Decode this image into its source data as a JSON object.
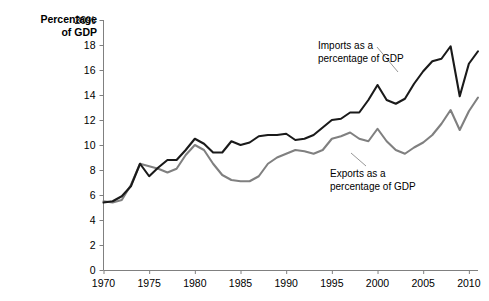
{
  "chart_data": {
    "type": "line",
    "title": "",
    "xlabel": "",
    "ylabel": "Percentage of GDP",
    "ylabel_line1": "Percentage",
    "ylabel_line2": "of GDP",
    "xlim": [
      1970,
      2011
    ],
    "ylim": [
      0,
      20
    ],
    "grid": false,
    "legend_position": "inline-annotations",
    "y_ticks": [
      0,
      2,
      4,
      6,
      8,
      10,
      12,
      14,
      16,
      18,
      20
    ],
    "y_tick_labels": [
      "0",
      "2",
      "4",
      "6",
      "8",
      "10",
      "12",
      "14",
      "16",
      "18",
      "20%"
    ],
    "x_ticks": [
      1970,
      1975,
      1980,
      1985,
      1990,
      1995,
      2000,
      2005,
      2010
    ],
    "x_tick_labels": [
      "1970",
      "1975",
      "1980",
      "1985",
      "1990",
      "1995",
      "2000",
      "2005",
      "2010"
    ],
    "x": [
      1970,
      1971,
      1972,
      1973,
      1974,
      1975,
      1976,
      1977,
      1978,
      1979,
      1980,
      1981,
      1982,
      1983,
      1984,
      1985,
      1986,
      1987,
      1988,
      1989,
      1990,
      1991,
      1992,
      1993,
      1994,
      1995,
      1996,
      1997,
      1998,
      1999,
      2000,
      2001,
      2002,
      2003,
      2004,
      2005,
      2006,
      2007,
      2008,
      2009,
      2010,
      2011
    ],
    "series": [
      {
        "name": "Imports as a percentage of GDP",
        "color": "#1a1a1a",
        "values": [
          5.4,
          5.5,
          5.9,
          6.7,
          8.5,
          7.5,
          8.2,
          8.8,
          8.8,
          9.6,
          10.5,
          10.1,
          9.4,
          9.4,
          10.3,
          10.0,
          10.2,
          10.7,
          10.8,
          10.8,
          10.9,
          10.4,
          10.5,
          10.8,
          11.4,
          12.0,
          12.1,
          12.6,
          12.6,
          13.6,
          14.8,
          13.6,
          13.3,
          13.7,
          14.9,
          15.9,
          16.7,
          16.9,
          17.9,
          13.9,
          16.5,
          17.5
        ]
      },
      {
        "name": "Exports as a percentage of GDP",
        "color": "#808080",
        "values": [
          5.5,
          5.4,
          5.6,
          6.8,
          8.5,
          8.3,
          8.1,
          7.8,
          8.1,
          9.2,
          10.0,
          9.6,
          8.5,
          7.6,
          7.2,
          7.1,
          7.1,
          7.5,
          8.5,
          9.0,
          9.3,
          9.6,
          9.5,
          9.3,
          9.6,
          10.5,
          10.7,
          11.0,
          10.5,
          10.3,
          11.3,
          10.3,
          9.6,
          9.3,
          9.8,
          10.2,
          10.8,
          11.7,
          12.8,
          11.2,
          12.7,
          13.8
        ]
      }
    ],
    "annotations": [
      {
        "id": "imports-annotation",
        "line1": "Imports as a",
        "line2": "percentage of GDP",
        "text": "Imports as a percentage of GDP"
      },
      {
        "id": "exports-annotation",
        "line1": "Exports as a",
        "line2": "percentage of GDP",
        "text": "Exports as a percentage of GDP"
      }
    ],
    "colors": {
      "imports_line": "#1a1a1a",
      "exports_line": "#808080",
      "axis": "#808080",
      "background": "#ffffff",
      "text": "#000000"
    }
  }
}
